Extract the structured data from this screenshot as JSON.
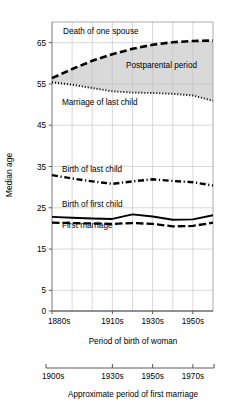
{
  "chart_data": {
    "type": "line",
    "title": "",
    "xlabel": "Period of birth of woman",
    "ylabel": "Median age",
    "secondary_xlabel": "Approximate period of first marriage",
    "ylim": [
      0,
      70
    ],
    "yticks": [
      0,
      5,
      15,
      25,
      35,
      45,
      55,
      65
    ],
    "ytick_labels": [
      "0",
      "5",
      "15",
      "25",
      "35",
      "45",
      "55",
      "65"
    ],
    "x": [
      "1880s",
      "1890s",
      "1900s",
      "1910s",
      "1920s",
      "1930s",
      "1940s",
      "1950s",
      "1960s"
    ],
    "xtick_labels": [
      "1880s",
      "1910s",
      "1930s",
      "1950s"
    ],
    "xtick_positions": [
      0,
      3,
      5,
      7
    ],
    "secondary_xtick_labels": [
      "1900s",
      "1930s",
      "1950s",
      "1970s"
    ],
    "secondary_xtick_positions": [
      0,
      3,
      5,
      7
    ],
    "grid": true,
    "legend": "inline-labels",
    "shaded_region": {
      "label": "Postparental period",
      "upper_series": "Death of one spouse",
      "lower_series": "Marriage of last child",
      "color": "#d9d9d9"
    },
    "series": [
      {
        "name": "Death of one spouse",
        "style": "dashed",
        "label": "Death of one spouse",
        "values": [
          56.4,
          58.6,
          60.6,
          62.2,
          63.5,
          64.5,
          65.1,
          65.4,
          65.5
        ]
      },
      {
        "name": "Marriage of last child",
        "style": "dotted",
        "label": "Marriage of last child",
        "values": [
          55.4,
          54.8,
          54.0,
          53.2,
          52.9,
          52.8,
          52.6,
          52.2,
          50.9
        ]
      },
      {
        "name": "Birth of last child",
        "style": "dash-dot",
        "label": "Birth of last child",
        "values": [
          32.9,
          32.1,
          31.4,
          30.8,
          31.4,
          31.9,
          31.5,
          31.2,
          30.4
        ]
      },
      {
        "name": "Birth of first child",
        "style": "solid",
        "label": "Birth of first child",
        "values": [
          22.8,
          22.6,
          22.4,
          22.3,
          23.4,
          22.9,
          22.1,
          22.2,
          23.2
        ]
      },
      {
        "name": "First marriage",
        "style": "dashed-thick",
        "label": "First marriage",
        "values": [
          21.4,
          21.3,
          21.2,
          21.1,
          21.3,
          21.1,
          20.5,
          20.6,
          21.4
        ]
      }
    ],
    "curve_labels": [
      {
        "text": "Death of one spouse",
        "x_px": 63,
        "y_px": 34
      },
      {
        "text": "Postparental period",
        "x_px": 126,
        "y_px": 68
      },
      {
        "text": "Marriage of last child",
        "x_px": 62,
        "y_px": 105
      },
      {
        "text": "Birth of last child",
        "x_px": 62,
        "y_px": 172
      },
      {
        "text": "Birth of first child",
        "x_px": 62,
        "y_px": 207
      },
      {
        "text": "First marriage",
        "x_px": 62,
        "y_px": 228
      }
    ]
  }
}
